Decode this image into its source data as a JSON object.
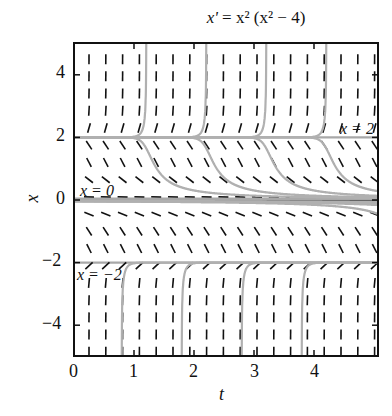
{
  "chart_data": {
    "type": "line",
    "title": "x' = x² (x² − 4)",
    "title_parts": {
      "lhs": "x'",
      "eq": " = ",
      "rhs": "x² (x² − 4)"
    },
    "xlabel": "t",
    "ylabel": "x",
    "xlim": [
      0,
      5.05
    ],
    "ylim": [
      -5,
      5
    ],
    "xticks": [
      0,
      1,
      2,
      3,
      4
    ],
    "yticks": [
      4,
      2,
      0,
      -2,
      -4
    ],
    "xtick_labels": [
      "0",
      "1",
      "2",
      "3",
      "4"
    ],
    "ytick_labels": [
      "4",
      "2",
      "0",
      "−2",
      "−4"
    ],
    "grid": false,
    "slope_field": {
      "t_step": 0.28,
      "x_step": 0.55,
      "equation": "x' = x^2 (x^2 - 4)"
    },
    "equilibria": [
      {
        "x": 2,
        "label": "x = 2",
        "stability": "unstable"
      },
      {
        "x": 0,
        "label": "x = 0",
        "stability": "semistable"
      },
      {
        "x": -2,
        "label": "x = −2",
        "stability": "stable"
      }
    ],
    "solution_curves": {
      "start_times": [
        1,
        2,
        3,
        4
      ],
      "description": "Solutions through x=2 region diverging upward near t=1,2,3,4; between 0 and 2 decreasing toward 0; between −2 and 0 decreasing toward −2; below −2 increasing toward −2"
    },
    "annotations": [
      {
        "text": "x = 2",
        "t": 4.55,
        "x": 2.35
      },
      {
        "text": "x = 0",
        "t": 0.35,
        "x": 0.35
      },
      {
        "text": "x = −2",
        "t": 0.4,
        "x": -2.35
      }
    ]
  }
}
